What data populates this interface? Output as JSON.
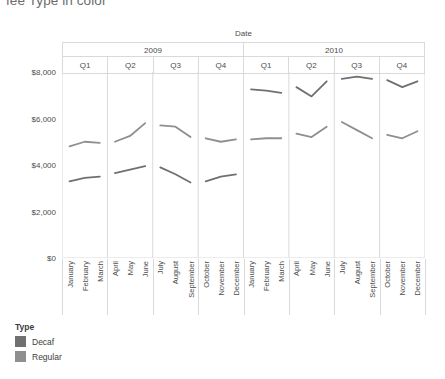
{
  "title": "fee Type in color",
  "legend": {
    "title": "Type",
    "items": [
      {
        "label": "Decaf",
        "color": "#707070"
      },
      {
        "label": "Regular",
        "color": "#8f8f8f"
      }
    ]
  },
  "axes": {
    "x_title": "Date",
    "y_title": "Profit",
    "y_ticks": [
      "$0",
      "$2,000",
      "$4,000",
      "$6,000",
      "$8,000"
    ]
  },
  "columns": {
    "years": [
      "2009",
      "2010"
    ],
    "quarters": [
      "Q1",
      "Q2",
      "Q3",
      "Q4",
      "Q1",
      "Q2",
      "Q3",
      "Q4"
    ]
  },
  "chart_data": {
    "type": "line",
    "title": "fee Type in color",
    "xlabel": "Date",
    "ylabel": "Profit",
    "ylim": [
      0,
      8000
    ],
    "ytick_values": [
      0,
      2000,
      4000,
      6000,
      8000
    ],
    "grid": false,
    "legend_position": "bottom-left",
    "panels": [
      "2009 Q1",
      "2009 Q2",
      "2009 Q3",
      "2009 Q4",
      "2010 Q1",
      "2010 Q2",
      "2010 Q3",
      "2010 Q4"
    ],
    "categories": [
      "January",
      "February",
      "March",
      "April",
      "May",
      "June",
      "July",
      "August",
      "September",
      "October",
      "November",
      "December",
      "January",
      "February",
      "March",
      "April",
      "May",
      "June",
      "July",
      "August",
      "September",
      "October",
      "November",
      "December"
    ],
    "series": [
      {
        "name": "Regular",
        "color": "#8f8f8f",
        "values": [
          4800,
          5000,
          4950,
          5000,
          5250,
          5800,
          5700,
          5650,
          5200,
          5150,
          5000,
          5100,
          5100,
          5150,
          5150,
          5350,
          5200,
          5650,
          5850,
          5500,
          5150,
          5300,
          5150,
          5450
        ]
      },
      {
        "name": "Decaf",
        "color": "#707070",
        "values": [
          3300,
          3450,
          3500,
          3650,
          3800,
          3950,
          3900,
          3600,
          3250,
          3300,
          3500,
          3600,
          7250,
          7200,
          7100,
          7350,
          6950,
          7600,
          7700,
          7800,
          7700,
          7650,
          7350,
          7600
        ]
      }
    ]
  }
}
